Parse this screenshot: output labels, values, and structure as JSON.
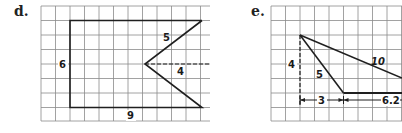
{
  "figures": [
    {
      "id": "d",
      "label": "d.",
      "shape": "rectangle with triangular notch",
      "dimensions": {
        "height": "6",
        "width": "9",
        "slant": "5",
        "notch_depth": "4"
      }
    },
    {
      "id": "e",
      "label": "e.",
      "shape": "obtuse triangle with height and base extension",
      "dimensions": {
        "height": "4",
        "short_side": "5",
        "long_side": "10",
        "offset": "3",
        "base": "6.2"
      }
    }
  ],
  "colors": {
    "grid": "#8a8a8a",
    "shape": "#1f1f1f",
    "background": "#ffffff"
  }
}
